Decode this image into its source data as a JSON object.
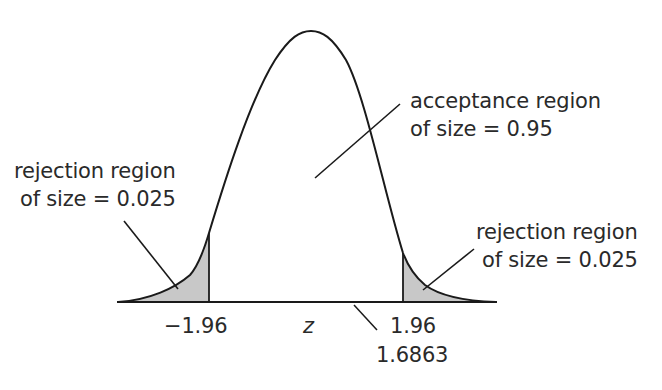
{
  "diagram": {
    "axis_variable": "z",
    "acceptance_label": {
      "line1": "acceptance region",
      "line2": "of size = 0.95"
    },
    "left_rejection_label": {
      "line1": "rejection region",
      "line2": "of size = 0.025"
    },
    "right_rejection_label": {
      "line1": "rejection region",
      "line2": "of size = 0.025"
    },
    "tick_labels": {
      "left_critical": "−1.96",
      "right_critical": "1.96",
      "test_statistic": "1.6863"
    },
    "colors": {
      "curve": "#1a1a1a",
      "shading": "#c8c8c8",
      "text": "#2a2a2a",
      "background": "#ffffff"
    }
  }
}
